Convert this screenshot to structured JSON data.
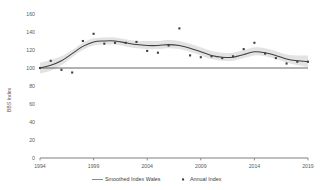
{
  "chart_data": {
    "type": "line",
    "title": "",
    "xlabel": "",
    "ylabel": "BBS Index",
    "xlim": [
      1994,
      2019
    ],
    "ylim": [
      0,
      160
    ],
    "grid": false,
    "legend_position": "bottom",
    "x_ticks": [
      "1994",
      "1999",
      "2004",
      "2009",
      "2014",
      "2019"
    ],
    "x_tick_values": [
      1994,
      1999,
      2004,
      2009,
      2014,
      2019
    ],
    "y_ticks": [
      "0",
      "20",
      "40",
      "60",
      "80",
      "100",
      "120",
      "140",
      "160"
    ],
    "y_tick_values": [
      0,
      20,
      40,
      60,
      80,
      100,
      120,
      140,
      160
    ],
    "reference_line": 100,
    "x": [
      1994,
      1995,
      1996,
      1997,
      1998,
      1999,
      2000,
      2001,
      2002,
      2003,
      2004,
      2005,
      2006,
      2007,
      2008,
      2009,
      2010,
      2011,
      2012,
      2013,
      2014,
      2015,
      2016,
      2017,
      2018,
      2019
    ],
    "series": [
      {
        "name": "Annual Index",
        "type": "scatter",
        "color": "#404040",
        "values": [
          100,
          108,
          98,
          95,
          130,
          138,
          127,
          128,
          128,
          129,
          119,
          117,
          125,
          144,
          114,
          112,
          113,
          111,
          113,
          121,
          128,
          116,
          111,
          105,
          107,
          107
        ]
      },
      {
        "name": "Smoothed Index Wales",
        "type": "line",
        "color": "#404040",
        "values": [
          100,
          103,
          108,
          116,
          124,
          129,
          130,
          130,
          128,
          126,
          125,
          125,
          126,
          125,
          122,
          118,
          114,
          112,
          112,
          115,
          118,
          117,
          114,
          110,
          108,
          107
        ]
      },
      {
        "name": "confidence-band-upper",
        "type": "band",
        "color": "#d9d9d9",
        "values": [
          106,
          109,
          113,
          120,
          128,
          133,
          134,
          134,
          132,
          130,
          130,
          130,
          131,
          130,
          127,
          123,
          119,
          117,
          117,
          120,
          123,
          122,
          119,
          115,
          114,
          114
        ]
      },
      {
        "name": "confidence-band-lower",
        "type": "band",
        "color": "#d9d9d9",
        "values": [
          94,
          97,
          103,
          112,
          120,
          125,
          126,
          126,
          124,
          122,
          121,
          121,
          122,
          121,
          118,
          114,
          110,
          108,
          108,
          111,
          114,
          113,
          110,
          106,
          103,
          101
        ]
      }
    ],
    "legend": [
      {
        "label": "Smoothed Index Wales",
        "marker": "line",
        "color": "#595959"
      },
      {
        "label": "Annual Index",
        "marker": "square",
        "color": "#404040"
      }
    ]
  }
}
